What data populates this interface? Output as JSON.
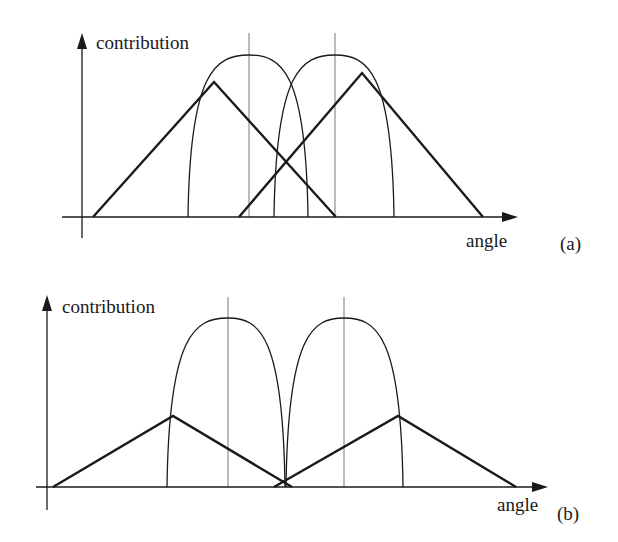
{
  "figure": {
    "panels": [
      {
        "id": "a",
        "tag": "(a)",
        "y_label": "contribution",
        "x_label": "angle",
        "axes": {
          "origin": [
            82,
            217
          ],
          "x_end": 518,
          "y_top": 33,
          "y_bottom": 238,
          "x_start": 62
        },
        "guides_x": [
          249,
          335
        ],
        "guide_top": 33,
        "parabolas": [
          {
            "left": 188,
            "right": 308,
            "peak_x": 249,
            "peak_y": 55
          },
          {
            "left": 274,
            "right": 394,
            "peak_x": 335,
            "peak_y": 55
          }
        ],
        "triangles": [
          {
            "start": 93,
            "peak_x": 214,
            "peak_y": 82,
            "end": 336
          },
          {
            "start": 239,
            "peak_x": 362,
            "peak_y": 73,
            "end": 483
          }
        ],
        "label_pos": {
          "y_label": [
            96,
            49
          ],
          "x_label": [
            466,
            247
          ],
          "tag": [
            560,
            250
          ]
        }
      },
      {
        "id": "b",
        "tag": "(b)",
        "y_label": "contribution",
        "x_label": "angle",
        "axes": {
          "origin": [
            47,
            487
          ],
          "x_end": 548,
          "y_top": 295,
          "y_bottom": 510,
          "x_start": 36
        },
        "guides_x": [
          228,
          344
        ],
        "guide_top": 297,
        "parabolas": [
          {
            "left": 167,
            "right": 285,
            "peak_x": 228,
            "peak_y": 318
          },
          {
            "left": 286,
            "right": 403,
            "peak_x": 344,
            "peak_y": 318
          }
        ],
        "triangles": [
          {
            "start": 53,
            "peak_x": 173,
            "peak_y": 416,
            "end": 292
          },
          {
            "start": 274,
            "peak_x": 398,
            "peak_y": 416,
            "end": 516
          }
        ],
        "label_pos": {
          "y_label": [
            62,
            313
          ],
          "x_label": [
            497,
            511
          ],
          "tag": [
            557,
            520
          ]
        }
      }
    ]
  },
  "chart_data": [
    {
      "type": "line",
      "title": "(a)",
      "xlabel": "angle",
      "ylabel": "contribution",
      "description": "Two wide triangular contribution functions overlapping two narrower parabolic (lobe) functions centered on vertical guide lines; triangles overlap heavily.",
      "series": [
        {
          "name": "triangle-1",
          "style": "thick",
          "points": [
            [
              93,
              0
            ],
            [
              214,
              135
            ],
            [
              336,
              0
            ]
          ]
        },
        {
          "name": "triangle-2",
          "style": "thick",
          "points": [
            [
              239,
              0
            ],
            [
              362,
              144
            ],
            [
              483,
              0
            ]
          ]
        },
        {
          "name": "lobe-1",
          "style": "thin",
          "shape": "parabola",
          "left": 188,
          "center": 249,
          "right": 308,
          "height": 162
        },
        {
          "name": "lobe-2",
          "style": "thin",
          "shape": "parabola",
          "left": 274,
          "center": 335,
          "right": 394,
          "height": 162
        }
      ],
      "guides": [
        249,
        335
      ],
      "grid": false
    },
    {
      "type": "line",
      "title": "(b)",
      "xlabel": "angle",
      "ylabel": "contribution",
      "description": "Two lower triangular contribution functions meeting near the axis between two taller, non-overlapping parabolic lobes centered on vertical guide lines.",
      "series": [
        {
          "name": "triangle-1",
          "style": "thick",
          "points": [
            [
              53,
              0
            ],
            [
              173,
              71
            ],
            [
              292,
              0
            ]
          ]
        },
        {
          "name": "triangle-2",
          "style": "thick",
          "points": [
            [
              274,
              0
            ],
            [
              398,
              71
            ],
            [
              516,
              0
            ]
          ]
        },
        {
          "name": "lobe-1",
          "style": "thin",
          "shape": "parabola",
          "left": 167,
          "center": 228,
          "right": 285,
          "height": 169
        },
        {
          "name": "lobe-2",
          "style": "thin",
          "shape": "parabola",
          "left": 286,
          "center": 344,
          "right": 403,
          "height": 169
        }
      ],
      "guides": [
        228,
        344
      ],
      "grid": false
    }
  ]
}
